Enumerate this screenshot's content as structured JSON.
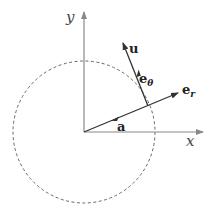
{
  "diagram": {
    "axes": {
      "x_label": "x",
      "y_label": "y"
    },
    "circle": {
      "style": "dashed",
      "color": "#666666"
    },
    "vectors": {
      "u": {
        "label": "u"
      },
      "e_theta": {
        "label": "e",
        "subscript": "θ"
      },
      "e_r": {
        "label": "e",
        "subscript": "r"
      },
      "a": {
        "label": "a"
      }
    },
    "colors": {
      "axis": "#888888",
      "vector": "#333333",
      "circle": "#666666"
    }
  }
}
